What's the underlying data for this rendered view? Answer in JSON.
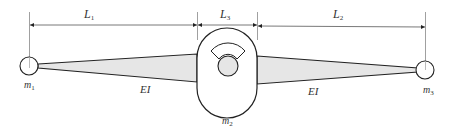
{
  "diagram": {
    "dimensions": [
      {
        "label": "L",
        "sub": "1"
      },
      {
        "label": "L",
        "sub": "3"
      },
      {
        "label": "L",
        "sub": "2"
      }
    ],
    "masses": [
      {
        "label": "m",
        "sub": "1"
      },
      {
        "label": "m",
        "sub": "2"
      },
      {
        "label": "m",
        "sub": "3"
      }
    ],
    "stiffness_labels": [
      "EI",
      "EI"
    ],
    "colors": {
      "stroke": "#222222",
      "beam_fill": "#e6e6e6",
      "hub_fill": "#e6e6e6",
      "dim_line": "#555555"
    }
  }
}
